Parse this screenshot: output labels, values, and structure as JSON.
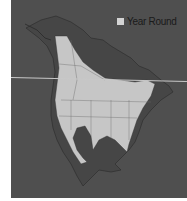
{
  "map": {
    "title": "",
    "legend": [
      {
        "label": "Year Round",
        "color": "#d4d4d4"
      }
    ],
    "colors": {
      "background": "#4f4f4f",
      "land": "#454545",
      "range": "#c6c6c6",
      "border": "#2a2a2a"
    }
  }
}
